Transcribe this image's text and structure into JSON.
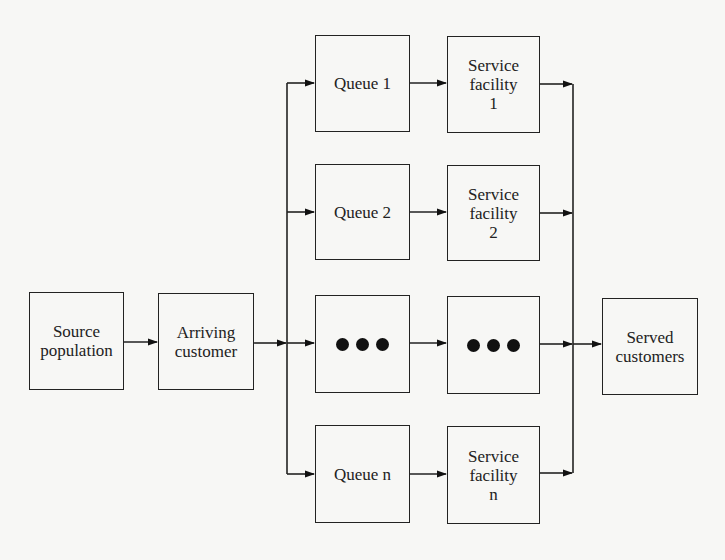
{
  "diagram": {
    "type": "queueing-system-block-diagram",
    "nodes": {
      "source": {
        "label": "Source\npopulation"
      },
      "arriving": {
        "label": "Arriving\ncustomer"
      },
      "served": {
        "label": "Served\ncustomers"
      },
      "channels": [
        {
          "queue": "Queue 1",
          "service": "Service\nfacility\n1"
        },
        {
          "queue": "Queue 2",
          "service": "Service\nfacility\n2"
        },
        {
          "queue": "•••",
          "service": "•••",
          "ellipsis": true
        },
        {
          "queue": "Queue n",
          "service": "Service\nfacility\nn"
        }
      ]
    },
    "edges": [
      [
        "source",
        "arriving"
      ],
      [
        "arriving",
        "queue-bus"
      ],
      [
        "queue-bus",
        "queue-1"
      ],
      [
        "queue-bus",
        "queue-2"
      ],
      [
        "queue-bus",
        "queue-ellipsis"
      ],
      [
        "queue-bus",
        "queue-n"
      ],
      [
        "queue-1",
        "service-1"
      ],
      [
        "queue-2",
        "service-2"
      ],
      [
        "queue-ellipsis",
        "service-ellipsis"
      ],
      [
        "queue-n",
        "service-n"
      ],
      [
        "service-1",
        "served-bus"
      ],
      [
        "service-2",
        "served-bus"
      ],
      [
        "service-ellipsis",
        "served-bus"
      ],
      [
        "service-n",
        "served-bus"
      ],
      [
        "served-bus",
        "served"
      ]
    ],
    "colors": {
      "stroke": "#222222",
      "background": "#f7f7f5"
    }
  }
}
